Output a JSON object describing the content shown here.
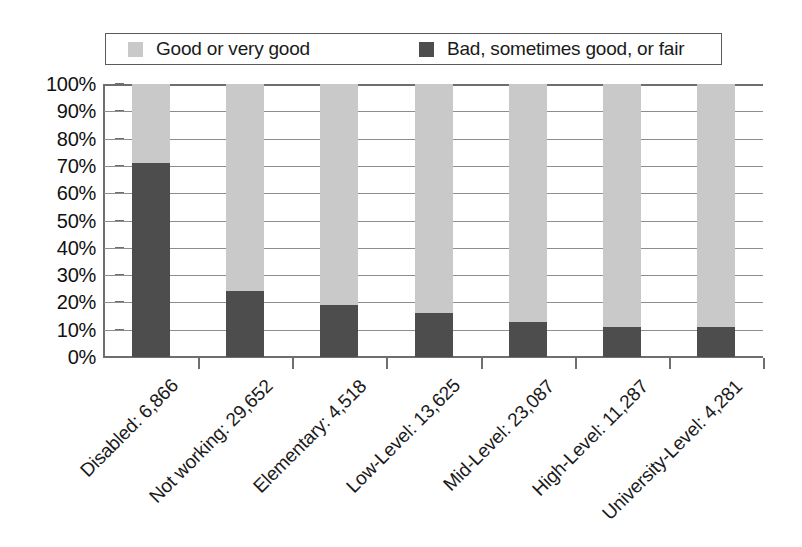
{
  "legend": {
    "position": "top",
    "entries": [
      {
        "label": "Good or very good",
        "color": "#c9c9c9",
        "swatch_name": "legend-swatch-good"
      },
      {
        "label": "Bad, sometimes good, or fair",
        "color": "#4d4d4d",
        "swatch_name": "legend-swatch-bad"
      }
    ]
  },
  "yaxis": {
    "ticks": [
      "100%",
      "90%",
      "80%",
      "70%",
      "60%",
      "50%",
      "40%",
      "30%",
      "20%",
      "10%",
      "0%"
    ]
  },
  "chart_data": {
    "type": "bar",
    "stacked": true,
    "title": "",
    "subtitle": "",
    "xlabel": "",
    "ylabel": "",
    "ylim": [
      0,
      100
    ],
    "ytick_labels": [
      "0%",
      "10%",
      "20%",
      "30%",
      "40%",
      "50%",
      "60%",
      "70%",
      "80%",
      "90%",
      "100%"
    ],
    "grid": true,
    "legend_position": "top",
    "categories": [
      "Disabled: 6,866",
      "Not working: 29,652",
      "Elementary: 4,518",
      "Low-Level: 13,625",
      "Mid-Level: 23,087",
      "High-Level: 11,287",
      "University-Level: 4,281"
    ],
    "series": [
      {
        "name": "Bad, sometimes good, or fair",
        "color": "#4d4d4d",
        "values": [
          71,
          24,
          19,
          16,
          13,
          11,
          11
        ]
      },
      {
        "name": "Good or very good",
        "color": "#c9c9c9",
        "values": [
          29,
          76,
          81,
          84,
          87,
          89,
          89
        ]
      }
    ]
  }
}
